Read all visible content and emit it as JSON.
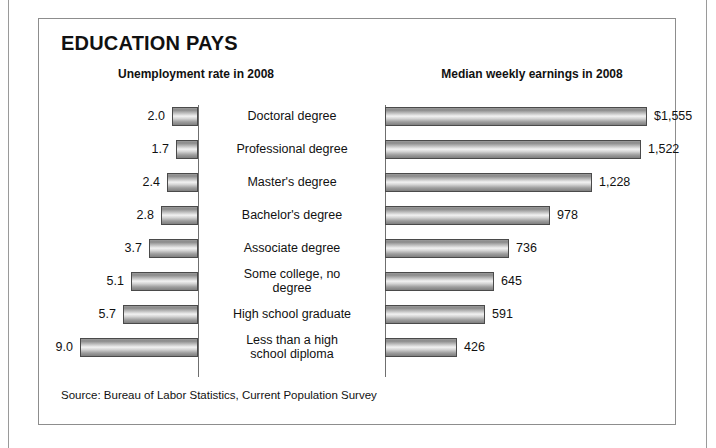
{
  "figure": {
    "title": "EDUCATION PAYS",
    "left_heading": "Unemployment rate in 2008",
    "right_heading": "Median weekly earnings in 2008",
    "source": "Source: Bureau of Labor Statistics, Current Population Survey"
  },
  "chart_data": {
    "type": "bar",
    "title": "EDUCATION PAYS",
    "orientation": "horizontal",
    "layout": "back-to-back paired bars, categories centered between panels",
    "categories": [
      "Doctoral degree",
      "Professional degree",
      "Master's degree",
      "Bachelor's degree",
      "Associate degree",
      "Some college, no degree",
      "High school graduate",
      "Less than a high school diploma"
    ],
    "category_lines": [
      [
        "Doctoral degree"
      ],
      [
        "Professional degree"
      ],
      [
        "Master's degree"
      ],
      [
        "Bachelor's degree"
      ],
      [
        "Associate degree"
      ],
      [
        "Some college, no",
        "degree"
      ],
      [
        "High school graduate"
      ],
      [
        "Less than a high",
        "school diploma"
      ]
    ],
    "series": [
      {
        "name": "Unemployment rate in 2008",
        "units": "percent",
        "direction": "left",
        "values": [
          2.0,
          1.7,
          2.4,
          2.8,
          3.7,
          5.1,
          5.7,
          9.0
        ],
        "labels": [
          "2.0",
          "1.7",
          "2.4",
          "2.8",
          "3.7",
          "5.1",
          "5.7",
          "9.0"
        ],
        "axis_max": 9.0
      },
      {
        "name": "Median weekly earnings in 2008",
        "units": "dollars",
        "direction": "right",
        "values": [
          1555,
          1522,
          1228,
          978,
          736,
          645,
          591,
          426
        ],
        "labels": [
          "$1,555",
          "1,522",
          "1,228",
          "978",
          "736",
          "645",
          "591",
          "426"
        ],
        "axis_max": 1555
      }
    ],
    "xlabel": "",
    "ylabel": "",
    "grid": false,
    "legend": "none",
    "annotations": [
      "Source: Bureau of Labor Statistics, Current Population Survey"
    ]
  },
  "style": {
    "bar_outline": "#4a4a4a",
    "axis_color": "#6f6f6f",
    "frame_color": "#8d8d8d",
    "text_color": "#111111",
    "background": "#ffffff"
  }
}
